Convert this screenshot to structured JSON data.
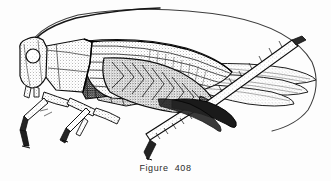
{
  "figure": {
    "caption": "Figure  408",
    "caption_label": "Figure",
    "caption_number": "408",
    "orientation": "lateral view, facing left",
    "style": "pen-and-ink stipple line drawing",
    "background_color": "#fdfdfd",
    "ink_color": "#1a1a1a",
    "midtone_color": "#6e6e6e",
    "light_tone_color": "#b8b8b8"
  },
  "anatomy": {
    "parts": [
      {
        "name": "antenna",
        "label": "antenna",
        "note": "long slender arc sweeping up and back over the body"
      },
      {
        "name": "compound-eye",
        "label": "compound eye",
        "note": "round, outlined, lightly stippled"
      },
      {
        "name": "head",
        "label": "head",
        "note": "left end, rounded front"
      },
      {
        "name": "pronotum",
        "label": "pronotum",
        "note": "saddle-shaped plate behind head, heavily stippled"
      },
      {
        "name": "thorax",
        "label": "thorax",
        "note": "dark shaded region behind pronotum"
      },
      {
        "name": "abdomen",
        "label": "abdomen",
        "note": "segmented, partly hidden by the folded forewing"
      },
      {
        "name": "forewing",
        "label": "forewing (tegmen)",
        "note": "long, veined, extends past the abdomen"
      },
      {
        "name": "hindwing",
        "label": "hindwing",
        "note": "folded tips projecting at the right"
      },
      {
        "name": "foreleg",
        "label": "foreleg",
        "note": "short, angled down and forward"
      },
      {
        "name": "midleg",
        "label": "midleg",
        "note": "short, angled down and back"
      },
      {
        "name": "hind-femur",
        "label": "hind femur",
        "note": "thick, chevron-patterned jumping leg"
      },
      {
        "name": "hind-tibia",
        "label": "hind tibia",
        "note": "long, spined, angled up and back"
      },
      {
        "name": "tarsus",
        "label": "tarsus",
        "note": "small foot segments at leg tips"
      }
    ]
  }
}
